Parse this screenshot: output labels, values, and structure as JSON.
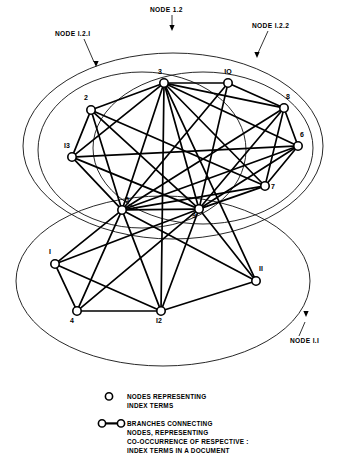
{
  "diagram": {
    "callouts": [
      {
        "id": "node-1-2",
        "label": "NODE 1.2",
        "label_x": 150,
        "label_y": 12,
        "line": "M172,15 L172,26",
        "arrow_x": 172,
        "arrow_y": 31
      },
      {
        "id": "node-1-2-1",
        "label": "NODE I.2.I",
        "label_x": 55,
        "label_y": 36,
        "line": "M84,39 L94,62",
        "arrow_x": 96,
        "arrow_y": 67
      },
      {
        "id": "node-1-2-2",
        "label": "NODE I.2.2",
        "label_x": 252,
        "label_y": 28,
        "line": "M268,31 L258,53",
        "arrow_x": 257,
        "arrow_y": 58
      },
      {
        "id": "node-1-1",
        "label": "NODE I.I",
        "label_x": 290,
        "label_y": 343,
        "line": "M299,336 L305,322",
        "arrow_x": 306,
        "arrow_y": 317
      }
    ],
    "groups": [
      {
        "id": "group-1-2",
        "label": "NODE 1.2",
        "cx": 173,
        "cy": 146,
        "rx": 150,
        "ry": 93,
        "rot": 0
      },
      {
        "id": "group-1-2-1",
        "label": "NODE I.2.I",
        "cx": 142,
        "cy": 150,
        "rx": 104,
        "ry": 78,
        "rot": 0
      },
      {
        "id": "group-1-2-2",
        "label": "NODE I.2.2",
        "cx": 203,
        "cy": 148,
        "rx": 110,
        "ry": 76,
        "rot": 0
      },
      {
        "id": "group-1-1",
        "label": "NODE I.I",
        "cx": 163,
        "cy": 281,
        "rx": 147,
        "ry": 85,
        "rot": 0
      }
    ],
    "nodes": [
      {
        "id": "1",
        "label": "I",
        "x": 55,
        "y": 264,
        "lx": 50,
        "ly": 254
      },
      {
        "id": "2",
        "label": "2",
        "x": 91,
        "y": 110,
        "lx": 86,
        "ly": 100
      },
      {
        "id": "3",
        "label": "3",
        "x": 164,
        "y": 83,
        "lx": 160,
        "ly": 74
      },
      {
        "id": "4",
        "label": "4",
        "x": 77,
        "y": 311,
        "lx": 72,
        "ly": 323
      },
      {
        "id": "5",
        "label": "5",
        "x": 122,
        "y": 210,
        "lx": 127,
        "ly": 202
      },
      {
        "id": "6",
        "label": "6",
        "x": 298,
        "y": 146,
        "lx": 302,
        "ly": 137
      },
      {
        "id": "7",
        "label": "7",
        "x": 265,
        "y": 186,
        "lx": 273,
        "ly": 189
      },
      {
        "id": "8",
        "label": "8",
        "x": 284,
        "y": 108,
        "lx": 288,
        "ly": 99
      },
      {
        "id": "9",
        "label": "9",
        "x": 199,
        "y": 209,
        "lx": 194,
        "ly": 218
      },
      {
        "id": "10",
        "label": "IO",
        "x": 228,
        "y": 83,
        "lx": 228,
        "ly": 74
      },
      {
        "id": "11",
        "label": "II",
        "x": 256,
        "y": 281,
        "lx": 261,
        "ly": 271
      },
      {
        "id": "12",
        "label": "I2",
        "x": 161,
        "y": 311,
        "lx": 159,
        "ly": 323
      },
      {
        "id": "13",
        "label": "I3",
        "x": 72,
        "y": 157,
        "lx": 67,
        "ly": 148
      }
    ],
    "edges": [
      [
        "2",
        "3"
      ],
      [
        "2",
        "13"
      ],
      [
        "2",
        "5"
      ],
      [
        "2",
        "9"
      ],
      [
        "2",
        "7"
      ],
      [
        "3",
        "10"
      ],
      [
        "3",
        "8"
      ],
      [
        "3",
        "6"
      ],
      [
        "3",
        "7"
      ],
      [
        "3",
        "9"
      ],
      [
        "3",
        "5"
      ],
      [
        "3",
        "13"
      ],
      [
        "3",
        "12"
      ],
      [
        "3",
        "11"
      ],
      [
        "10",
        "8"
      ],
      [
        "10",
        "9"
      ],
      [
        "10",
        "5"
      ],
      [
        "8",
        "6"
      ],
      [
        "8",
        "7"
      ],
      [
        "8",
        "9"
      ],
      [
        "8",
        "5"
      ],
      [
        "6",
        "7"
      ],
      [
        "6",
        "9"
      ],
      [
        "6",
        "5"
      ],
      [
        "6",
        "13"
      ],
      [
        "7",
        "9"
      ],
      [
        "7",
        "5"
      ],
      [
        "13",
        "5"
      ],
      [
        "13",
        "9"
      ],
      [
        "5",
        "9"
      ],
      [
        "5",
        "1"
      ],
      [
        "5",
        "4"
      ],
      [
        "5",
        "12"
      ],
      [
        "5",
        "11"
      ],
      [
        "9",
        "1"
      ],
      [
        "9",
        "12"
      ],
      [
        "9",
        "11"
      ],
      [
        "9",
        "4"
      ],
      [
        "1",
        "4"
      ],
      [
        "1",
        "12"
      ],
      [
        "4",
        "12"
      ],
      [
        "12",
        "11"
      ]
    ],
    "legend": {
      "items": [
        {
          "id": "legend-node",
          "glyph": "node-circle",
          "lines": [
            "NODES REPRESENTING",
            "INDEX TERMS"
          ]
        },
        {
          "id": "legend-branch",
          "glyph": "branch-dumbbell",
          "lines": [
            "BRANCHES CONNECTING",
            "NODES, REPRESENTING",
            "CO-OCCURRENCE OF RESPECTIVE :",
            "INDEX TERMS IN A DOCUMENT"
          ]
        }
      ]
    },
    "colors": {
      "ink": "#000000",
      "paper": "#ffffff",
      "outline": "#111111"
    }
  }
}
